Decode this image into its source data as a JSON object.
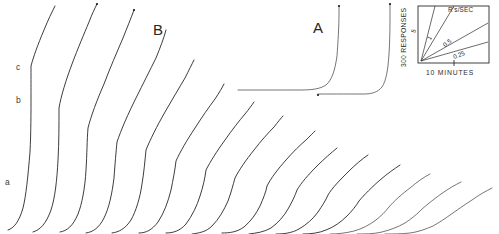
{
  "figure": {
    "background": "#ffffff",
    "ink_color": "#1a1a1a"
  },
  "panels": [
    {
      "id": "panel-b",
      "label": "B",
      "x": 153,
      "y": 22
    },
    {
      "id": "panel-a",
      "label": "A",
      "x": 313,
      "y": 20
    }
  ],
  "curve_labels": [
    {
      "id": "label-c",
      "label": "c",
      "x": 16,
      "y": 63
    },
    {
      "id": "label-b",
      "label": "b",
      "x": 16,
      "y": 96
    },
    {
      "id": "label-a",
      "label": "a",
      "x": 5,
      "y": 178
    }
  ],
  "inset": {
    "title": "R's/SEC",
    "y_axis_label": "300 RESPONSES",
    "x_axis_label": "10 MINUTES",
    "slopes": [
      {
        "value": "5",
        "label_x": 20,
        "label_y": 26,
        "rotate": -72
      },
      {
        "value": "1",
        "label_x": 36,
        "label_y": 33,
        "rotate": -60
      },
      {
        "value": "0.5",
        "label_x": 51,
        "label_y": 38,
        "rotate": -38
      },
      {
        "value": "0.25",
        "label_x": 61,
        "label_y": 50,
        "rotate": -22
      }
    ]
  },
  "chart_data": {
    "type": "line",
    "xlabel": "10 MINUTES",
    "ylabel": "300 RESPONSES",
    "grid": false,
    "legend": "none",
    "calibration_slopes": [
      5,
      1,
      0.5,
      0.25
    ],
    "calibration_slope_units": "R's/SEC",
    "series": [
      {
        "name": "record-01",
        "panel": "B",
        "path": "M 8,230 C 14,228 19,222 23,208 C 26,196 28,176 30,152 C 31,132 31,112 31,96 C 31,84 31,74 31,66 C 33,58 38,44 44,30 C 48,20 52,12 55,6"
      },
      {
        "name": "record-02",
        "panel": "B",
        "path": "M 33,232 C 40,230 46,224 51,210 C 55,198 57,180 58,160 C 59,142 59,124 59,108 C 61,96 66,80 72,64 C 78,48 84,34 89,22 C 92,14 95,8 97,4"
      },
      {
        "name": "record-03",
        "panel": "B",
        "path": "M 60,232 C 67,231 73,226 78,214 C 82,204 85,188 86,170 C 87,154 87,140 88,128 C 91,116 97,100 104,84 C 110,68 117,52 123,38 C 127,28 131,18 134,10"
      },
      {
        "name": "record-04",
        "panel": "B",
        "path": "M 86,233 C 93,232 99,228 104,218 C 109,208 112,194 114,178 C 115,164 116,152 117,142 C 121,130 128,114 136,98 C 143,84 150,70 156,58 C 160,48 164,38 166,30"
      },
      {
        "name": "record-05",
        "panel": "B",
        "path": "M 112,233 C 119,232 125,229 131,220 C 136,211 140,198 142,184 C 144,172 145,160 146,150 C 150,140 157,126 165,112 C 172,100 179,88 185,78 C 189,70 192,64 194,60"
      },
      {
        "name": "record-06",
        "panel": "B",
        "path": "M 139,233 C 146,233 152,230 158,222 C 164,213 168,202 171,190 C 173,180 175,170 176,161 C 180,152 187,140 195,128 C 202,117 209,107 215,99 C 219,93 222,88 224,84"
      },
      {
        "name": "record-07",
        "panel": "B",
        "path": "M 166,233 C 173,233 180,231 186,224 C 192,216 197,206 200,196 C 203,187 205,178 206,170 C 210,162 217,151 225,140 C 232,130 239,121 245,114 C 249,109 252,105 254,102"
      },
      {
        "name": "record-08",
        "panel": "B",
        "path": "M 192,234 C 199,233 206,232 212,226 C 219,219 224,210 228,201 C 231,193 233,185 235,178 C 239,170 246,160 254,150 C 261,141 268,133 274,127 C 278,122 281,118 283,116"
      },
      {
        "name": "record-09",
        "panel": "A",
        "path": "M 222,233 C 230,233 237,232 244,227 C 251,221 256,214 260,206 C 263,199 266,192 267,186 C 271,178 278,169 286,160 C 293,152 300,145 306,140 C 310,136 313,133 315,131"
      },
      {
        "name": "record-10",
        "panel": "A",
        "path": "M 249,234 C 257,233 264,232 271,228 C 278,223 284,216 288,209 C 292,202 295,196 297,190 C 301,183 309,174 317,166 C 324,159 331,153 337,148"
      },
      {
        "name": "record-11",
        "panel": "A",
        "path": "M 276,234 C 284,234 292,233 299,229 C 306,225 313,219 318,212 C 322,206 326,200 328,195 C 332,188 340,180 348,172 C 355,165 362,159 368,155"
      },
      {
        "name": "record-12",
        "panel": "A",
        "path": "M 303,234 C 311,234 319,233 326,230 C 334,227 341,222 347,216 C 352,211 356,206 359,201 C 364,195 372,187 380,180 C 387,174 394,169 400,165"
      },
      {
        "name": "record-13",
        "panel": "A",
        "path": "M 330,234 C 338,234 346,233 354,231 C 362,229 369,225 376,220 C 381,216 386,211 389,207 C 394,201 402,194 410,188 C 417,182 424,177 430,174"
      },
      {
        "name": "record-14",
        "panel": "A",
        "path": "M 357,234 C 365,234 374,234 382,232 C 390,230 398,227 405,223 C 411,219 416,215 420,211 C 425,206 433,200 441,194 C 448,189 455,185 461,182"
      },
      {
        "name": "record-15",
        "panel": "A",
        "path": "M 385,234 C 393,234 402,234 410,233 C 418,232 426,229 433,226 C 440,222 446,218 450,215 C 456,211 464,205 472,200 C 479,195 486,191 492,188"
      },
      {
        "name": "record-a-steep-1",
        "panel": "A",
        "path": "M 238,90 C 258,90 282,90 300,90 C 312,90 320,89 326,85 C 332,80 335,70 337,56 C 338,42 339,26 339,14 C 339,10 339,7 339,6"
      },
      {
        "name": "record-a-steep-2",
        "panel": "A",
        "path": "M 318,94 C 334,94 352,94 364,94 C 372,94 378,92 382,87 C 386,81 388,70 389,54 C 390,38 390,22 390,10 C 390,7 390,5 390,4"
      }
    ],
    "event_pips": [
      {
        "x": 339,
        "y": 6
      },
      {
        "x": 390,
        "y": 4
      },
      {
        "x": 318,
        "y": 95
      },
      {
        "x": 97,
        "y": 4
      },
      {
        "x": 134,
        "y": 10
      }
    ]
  }
}
